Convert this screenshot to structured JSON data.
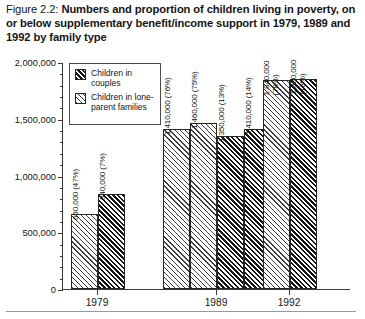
{
  "figure": {
    "label": "Figure 2.2:",
    "title": "Numbers and proportion of children living in poverty, on or below supplementary benefit/income support in 1979, 1989 and 1992 by family type"
  },
  "legend": {
    "items": [
      {
        "label": "Children in couples",
        "pattern": "dark"
      },
      {
        "label": "Children in lone-parent families",
        "pattern": "light"
      }
    ]
  },
  "axis": {
    "y_ticks": [
      "0",
      "500,000",
      "1,000,000",
      "1,500,000",
      "2,000,000"
    ],
    "x_ticks": [
      "1979",
      "1989",
      "1992"
    ]
  },
  "chart_data": {
    "type": "bar",
    "title": "Numbers and proportion of children living in poverty, on or below supplementary benefit/income support in 1979, 1989 and 1992 by family type",
    "xlabel": "",
    "ylabel": "",
    "ylim": [
      0,
      2000000
    ],
    "ytick_values": [
      0,
      500000,
      1000000,
      1500000,
      2000000
    ],
    "minor_tick_step": 100000,
    "grid": false,
    "legend_position": "inside-top-left",
    "categories": [
      "1979",
      "1989",
      "1992"
    ],
    "bars": [
      {
        "group": "1979",
        "pattern": "light",
        "value": 660000,
        "percent": "47%",
        "label": "660,000 (47%)"
      },
      {
        "group": "1979",
        "pattern": "dark",
        "value": 840000,
        "percent": "7%",
        "label": "840,000 (7%)"
      },
      {
        "group": "1989",
        "pattern": "light",
        "value": 1410000,
        "percent": "76%",
        "label": "1,410,000 (76%)"
      },
      {
        "group": "1989",
        "pattern": "light",
        "value": 1460000,
        "percent": "75%",
        "label": "1,460,000 (75%)"
      },
      {
        "group": "1989",
        "pattern": "dark",
        "value": 1350000,
        "percent": "13%",
        "label": "1,350,000 (13%)"
      },
      {
        "group": "1989",
        "pattern": "dark",
        "value": 1410000,
        "percent": "14%",
        "label": "1,410,000 (14%)"
      },
      {
        "group": "1992",
        "pattern": "light",
        "value": 1840000,
        "percent": "78%",
        "label": "1,840,000\n(78%)"
      },
      {
        "group": "1992",
        "pattern": "dark",
        "value": 1850000,
        "percent": "18%",
        "label": "1,850,000\n(18%)"
      }
    ]
  }
}
